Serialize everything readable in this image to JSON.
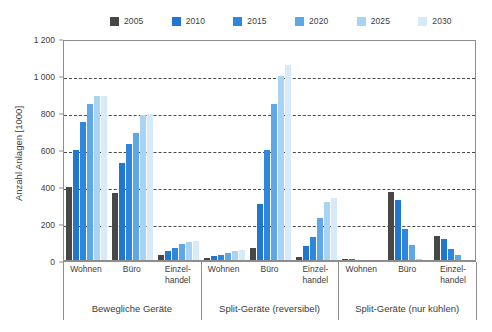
{
  "chart_data": {
    "type": "bar",
    "title": "",
    "xlabel": "",
    "ylabel": "Anzahl Anlagen [1000]",
    "ylim": [
      0,
      1200
    ],
    "ytick_labels": [
      "0",
      "200",
      "400",
      "600",
      "800",
      "1 000",
      "1 200"
    ],
    "ytick_values": [
      0,
      200,
      400,
      600,
      800,
      1000,
      1200
    ],
    "grid": true,
    "legend_position": "top",
    "categories": [
      "Wohnen",
      "Büro",
      "Einzel-\nhandel",
      "Wohnen",
      "Büro",
      "Einzel-\nhandel",
      "Wohnen",
      "Büro",
      "Einzel-\nhandel"
    ],
    "groups": [
      {
        "label": "Bewegliche Geräte",
        "categories": [
          "Wohnen",
          "Büro",
          "Einzel-\nhandel"
        ]
      },
      {
        "label": "Split-Geräte (reversibel)",
        "categories": [
          "Wohnen",
          "Büro",
          "Einzel-\nhandel"
        ]
      },
      {
        "label": "Split-Geräte (nur kühlen)",
        "categories": [
          "Wohnen",
          "Büro",
          "Einzel-\nhandel"
        ]
      }
    ],
    "series": [
      {
        "name": "2005",
        "color": "#474747",
        "values": [
          400,
          370,
          30,
          15,
          70,
          20,
          10,
          375,
          135
        ]
      },
      {
        "name": "2010",
        "color": "#1f77d0",
        "values": [
          600,
          530,
          55,
          25,
          310,
          80,
          10,
          330,
          120
        ]
      },
      {
        "name": "2015",
        "color": "#2f86dd",
        "values": [
          750,
          630,
          70,
          35,
          600,
          130,
          5,
          175,
          65
        ]
      },
      {
        "name": "2020",
        "color": "#5fa8e8",
        "values": [
          850,
          690,
          90,
          45,
          850,
          230,
          3,
          85,
          30
        ]
      },
      {
        "name": "2025",
        "color": "#a8d3f2",
        "values": [
          890,
          790,
          105,
          55,
          1000,
          320,
          2,
          10,
          5
        ]
      },
      {
        "name": "2030",
        "color": "#d6eaf9",
        "values": [
          890,
          795,
          110,
          60,
          1060,
          340,
          2,
          5,
          2
        ]
      }
    ]
  }
}
